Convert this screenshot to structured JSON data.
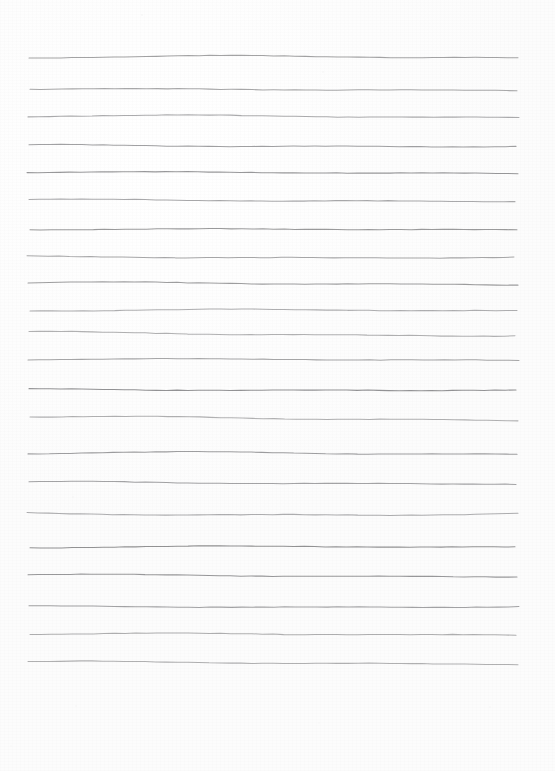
{
  "page": {
    "width": 555,
    "height": 771,
    "background_color": "#fdfdfd",
    "paper_tone": "#ffffff",
    "orientation": "portrait",
    "content_text": ""
  },
  "rules": {
    "kind": "hand-drawn-horizontal-rules",
    "line_color": "#8e8e90",
    "line_width_px": 1.05,
    "count": 22,
    "left_margin_px": 29,
    "right_margin_px": 518,
    "top_margin_px": 58,
    "bottom_margin_px": 663,
    "blank_footer_px": 108,
    "average_spacing_px": 28.8,
    "y_positions": [
      58,
      90,
      117,
      146,
      173,
      201,
      230,
      257,
      284,
      311,
      333,
      360,
      390,
      418,
      454,
      483,
      514,
      548,
      576,
      607,
      635,
      663
    ],
    "waviness": [
      {
        "x0": 29,
        "x1": 518,
        "y": 58,
        "amp": 3.0,
        "phase": 0.2,
        "tilt": -0.8
      },
      {
        "x0": 30,
        "x1": 517,
        "y": 90,
        "amp": 1.8,
        "phase": 1.1,
        "tilt": -0.5
      },
      {
        "x0": 28,
        "x1": 519,
        "y": 117,
        "amp": 2.6,
        "phase": 0.6,
        "tilt": -0.3
      },
      {
        "x0": 29,
        "x1": 516,
        "y": 146,
        "amp": 2.2,
        "phase": 2.0,
        "tilt": -0.6
      },
      {
        "x0": 27,
        "x1": 518,
        "y": 173,
        "amp": 1.6,
        "phase": 0.9,
        "tilt": -0.4
      },
      {
        "x0": 29,
        "x1": 515,
        "y": 201,
        "amp": 2.4,
        "phase": 1.6,
        "tilt": -1.2
      },
      {
        "x0": 30,
        "x1": 517,
        "y": 230,
        "amp": 1.4,
        "phase": 0.4,
        "tilt": -0.7
      },
      {
        "x0": 27,
        "x1": 514,
        "y": 257,
        "amp": 2.0,
        "phase": 2.4,
        "tilt": -0.2
      },
      {
        "x0": 28,
        "x1": 518,
        "y": 284,
        "amp": 2.8,
        "phase": 1.3,
        "tilt": -0.9
      },
      {
        "x0": 30,
        "x1": 517,
        "y": 311,
        "amp": 2.1,
        "phase": 0.1,
        "tilt": -0.6
      },
      {
        "x0": 29,
        "x1": 515,
        "y": 333,
        "amp": 2.5,
        "phase": 1.9,
        "tilt": 1.6
      },
      {
        "x0": 28,
        "x1": 519,
        "y": 360,
        "amp": 1.7,
        "phase": 0.7,
        "tilt": -0.4
      },
      {
        "x0": 29,
        "x1": 516,
        "y": 390,
        "amp": 1.9,
        "phase": 2.2,
        "tilt": -0.8
      },
      {
        "x0": 30,
        "x1": 518,
        "y": 418,
        "amp": 2.6,
        "phase": 1.0,
        "tilt": 1.2
      },
      {
        "x0": 28,
        "x1": 517,
        "y": 454,
        "amp": 3.0,
        "phase": 0.5,
        "tilt": -0.5
      },
      {
        "x0": 29,
        "x1": 516,
        "y": 483,
        "amp": 2.3,
        "phase": 1.7,
        "tilt": -0.3
      },
      {
        "x0": 27,
        "x1": 518,
        "y": 514,
        "amp": 2.9,
        "phase": 2.6,
        "tilt": -0.7
      },
      {
        "x0": 30,
        "x1": 515,
        "y": 548,
        "amp": 2.0,
        "phase": 0.3,
        "tilt": -1.4
      },
      {
        "x0": 28,
        "x1": 517,
        "y": 576,
        "amp": 2.4,
        "phase": 1.4,
        "tilt": -0.6
      },
      {
        "x0": 29,
        "x1": 519,
        "y": 607,
        "amp": 1.8,
        "phase": 2.1,
        "tilt": -1.0
      },
      {
        "x0": 30,
        "x1": 516,
        "y": 635,
        "amp": 2.2,
        "phase": 0.8,
        "tilt": -0.9
      },
      {
        "x0": 28,
        "x1": 518,
        "y": 663,
        "amp": 2.6,
        "phase": 1.5,
        "tilt": -0.4
      }
    ]
  },
  "specks": [
    {
      "x": 141,
      "y": 14,
      "size": 2,
      "opacity": 0.5
    },
    {
      "x": 322,
      "y": 71,
      "size": 2,
      "opacity": 0.4
    },
    {
      "x": 72,
      "y": 496,
      "size": 2,
      "opacity": 0.4
    },
    {
      "x": 75,
      "y": 705,
      "size": 2,
      "opacity": 0.45
    },
    {
      "x": 10,
      "y": 745,
      "size": 2,
      "opacity": 0.35
    },
    {
      "x": 489,
      "y": 706,
      "size": 2,
      "opacity": 0.4
    },
    {
      "x": 318,
      "y": 722,
      "size": 2,
      "opacity": 0.35
    }
  ]
}
